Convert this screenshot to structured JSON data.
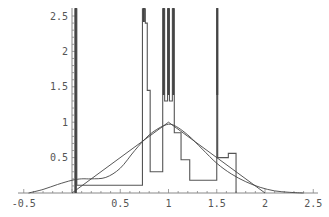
{
  "chart_data": {
    "type": "line",
    "title": "",
    "xlabel": "",
    "ylabel": "",
    "xlim": [
      -0.55,
      2.6
    ],
    "ylim": [
      0,
      2.55
    ],
    "grid": false,
    "legend": null,
    "x_ticks": [
      "-0.5",
      "0.5",
      "1",
      "1.5",
      "2",
      "2.5"
    ],
    "x_tick_values": [
      -0.5,
      0.5,
      1,
      1.5,
      2,
      2.5
    ],
    "y_ticks": [
      "0.5",
      "1",
      "1.5",
      "2",
      "2.5"
    ],
    "y_tick_values": [
      0.5,
      1,
      1.5,
      2,
      2.5
    ],
    "series": [
      {
        "name": "histogram-steps",
        "style": "step",
        "points": [
          [
            0.03,
            0
          ],
          [
            0.03,
            2.6
          ],
          [
            0.05,
            2.6
          ],
          [
            0.05,
            0.11
          ],
          [
            0.73,
            0.11
          ],
          [
            0.73,
            2.6
          ],
          [
            0.76,
            2.6
          ],
          [
            0.76,
            2.4
          ],
          [
            0.78,
            2.4
          ],
          [
            0.78,
            1.45
          ],
          [
            0.81,
            1.45
          ],
          [
            0.81,
            0.3
          ],
          [
            0.94,
            0.3
          ],
          [
            0.94,
            2.6
          ],
          [
            0.96,
            2.6
          ],
          [
            0.96,
            1.3
          ],
          [
            0.99,
            1.3
          ],
          [
            0.99,
            2.6
          ],
          [
            1.01,
            2.6
          ],
          [
            1.01,
            1.3
          ],
          [
            1.04,
            1.3
          ],
          [
            1.04,
            2.6
          ],
          [
            1.06,
            2.6
          ],
          [
            1.06,
            0.85
          ],
          [
            1.13,
            0.85
          ],
          [
            1.13,
            0.47
          ],
          [
            1.22,
            0.47
          ],
          [
            1.22,
            0.18
          ],
          [
            1.5,
            0.18
          ],
          [
            1.5,
            2.6
          ],
          [
            1.51,
            2.6
          ],
          [
            1.51,
            0.5
          ],
          [
            1.62,
            0.5
          ],
          [
            1.62,
            0.56
          ],
          [
            1.7,
            0.56
          ],
          [
            1.7,
            0
          ]
        ]
      },
      {
        "name": "triangular-density",
        "style": "line",
        "points": [
          [
            0,
            0
          ],
          [
            1,
            1
          ],
          [
            2,
            0
          ]
        ]
      },
      {
        "name": "kernel-density",
        "style": "smooth",
        "points": [
          [
            -0.45,
            0.0
          ],
          [
            -0.3,
            0.05
          ],
          [
            -0.15,
            0.12
          ],
          [
            0,
            0.18
          ],
          [
            0.1,
            0.2
          ],
          [
            0.2,
            0.2
          ],
          [
            0.35,
            0.22
          ],
          [
            0.5,
            0.35
          ],
          [
            0.65,
            0.6
          ],
          [
            0.8,
            0.82
          ],
          [
            0.95,
            0.95
          ],
          [
            1.05,
            0.96
          ],
          [
            1.2,
            0.82
          ],
          [
            1.35,
            0.62
          ],
          [
            1.5,
            0.42
          ],
          [
            1.65,
            0.27
          ],
          [
            1.8,
            0.16
          ],
          [
            1.95,
            0.08
          ],
          [
            2.1,
            0.03
          ],
          [
            2.25,
            0.01
          ],
          [
            2.4,
            0.0
          ]
        ]
      }
    ]
  },
  "colors": {
    "axis": "#888888",
    "line": "#555555",
    "thick_line": "#444444",
    "text": "#555555"
  }
}
